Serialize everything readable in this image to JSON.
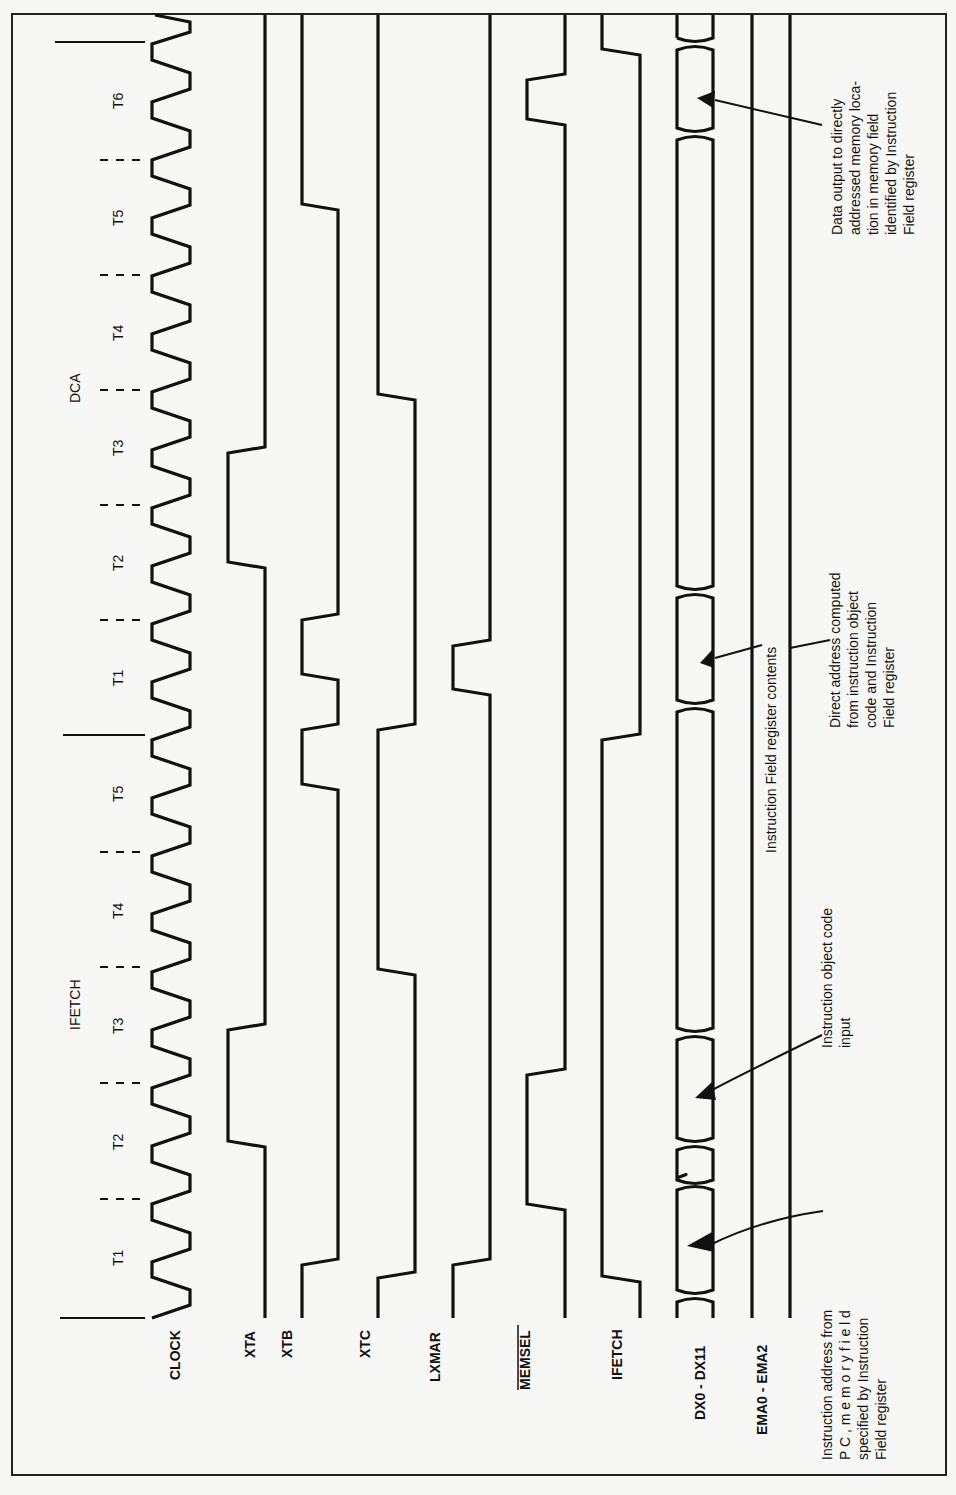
{
  "diagram": {
    "title_phases": [
      {
        "label": "IFETCH",
        "x": 75,
        "y": 1000
      },
      {
        "label": "DCA",
        "x": 75,
        "y": 385
      }
    ],
    "t_states": [
      {
        "label": "T1",
        "y": 1257
      },
      {
        "label": "T2",
        "y": 1141
      },
      {
        "label": "T3",
        "y": 1025
      },
      {
        "label": "T4",
        "y": 910
      },
      {
        "label": "T5",
        "y": 793
      },
      {
        "label": "T1",
        "y": 677
      },
      {
        "label": "T2",
        "y": 562
      },
      {
        "label": "T3",
        "y": 447
      },
      {
        "label": "T4",
        "y": 332
      },
      {
        "label": "T5",
        "y": 217
      },
      {
        "label": "T6",
        "y": 100
      }
    ],
    "signals": [
      {
        "name": "CLOCK",
        "overbar": false
      },
      {
        "name": "XTA",
        "overbar": false
      },
      {
        "name": "XTB",
        "overbar": false
      },
      {
        "name": "XTC",
        "overbar": false
      },
      {
        "name": "LXMAR",
        "overbar": false
      },
      {
        "name": "MEMSEL",
        "overbar": true
      },
      {
        "name": "IFETCH",
        "overbar": false
      },
      {
        "name": "DX0 - DX11",
        "overbar": false
      },
      {
        "name": "EMA0 - EMA2",
        "overbar": false
      }
    ],
    "annotations": {
      "instruction_address": [
        "Instruction address from",
        "P C ,    m e m o r y    f i e l d",
        "specified by Instruction",
        "Field register"
      ],
      "instruction_object_code": [
        "Instruction   object   code",
        "input"
      ],
      "instruction_field_contents": [
        "Instruction Field register contents"
      ],
      "direct_address": [
        "Direct address computed",
        "from   instruction   object",
        "code   and   Instruction",
        "Field register"
      ],
      "data_output": [
        "Data  output  to  directly",
        "addressed memory loca-",
        "tion  in  memory  field",
        "identified by Instruction",
        "Field register"
      ]
    }
  }
}
